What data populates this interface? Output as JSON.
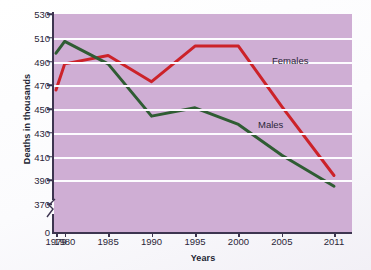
{
  "chart_data": {
    "type": "line",
    "title": "",
    "xlabel": "Years",
    "ylabel": "Deaths in thousands",
    "x": [
      1979,
      1980,
      1985,
      1990,
      1995,
      2000,
      2005,
      2011
    ],
    "categories": [
      "1979",
      "1980",
      "1985",
      "1990",
      "1995",
      "2000",
      "2005",
      "2011"
    ],
    "series": [
      {
        "name": "Females",
        "color": "#cc2229",
        "values": [
          466,
          488,
          495,
          473,
          503,
          503,
          452,
          394
        ]
      },
      {
        "name": "Males",
        "color": "#2f5c33",
        "values": [
          497,
          507,
          488,
          444,
          451,
          437,
          411,
          385
        ]
      }
    ],
    "ylim": [
      370,
      530
    ],
    "yticks": [
      370,
      390,
      410,
      430,
      450,
      470,
      490,
      510,
      530
    ],
    "ytick_labels": [
      "370",
      "390",
      "410",
      "430",
      "450",
      "470",
      "490",
      "510",
      "530"
    ],
    "axis_origin_label": "0",
    "axis_break": true,
    "grid": true,
    "gridlines_at": [
      390,
      410,
      430,
      450,
      470,
      490,
      510
    ],
    "legend": "inline-annotations",
    "plot_background": "#cfaed4",
    "gridline_color": "#fdfcff"
  },
  "annotations": {
    "females": "Females",
    "males": "Males"
  }
}
